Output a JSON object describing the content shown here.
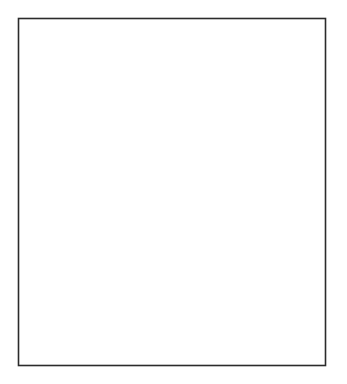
{
  "figure": {
    "width": 347,
    "height": 384,
    "background": "#ffffff",
    "border_color": "#2b2b2b",
    "axis_color": "#2b2b2b"
  },
  "chart_data": [
    {
      "type": "line",
      "panel": "top",
      "title": "Percent with High Risk Behavior",
      "xlabel": "",
      "ylabel": "",
      "xlim": [
        1981,
        1993
      ],
      "ylim": [
        0,
        75
      ],
      "yticks": [
        0,
        10,
        20,
        30,
        40,
        50,
        60,
        70
      ],
      "ytick_labels": [
        "0",
        "10",
        "20",
        "30",
        "40",
        "50",
        "60",
        "70"
      ],
      "xticks": [
        1981,
        1982,
        1983,
        1984,
        1985,
        1986,
        1987,
        1988,
        1989,
        1990,
        1991,
        1992,
        1993
      ],
      "xtick_labels": [],
      "grid": false,
      "legend": "none",
      "series": [
        {
          "name": "Percent with high risk behavior",
          "color": "#3a3a3a",
          "x": [
            1981.0,
            1981.5,
            1982.0,
            1982.5,
            1983.0,
            1983.2,
            1983.4,
            1983.6,
            1983.8,
            1984.0,
            1984.2,
            1984.4,
            1984.6,
            1984.8,
            1985.0,
            1985.2,
            1985.4,
            1985.6,
            1985.8,
            1986.0,
            1986.2,
            1986.4,
            1986.6,
            1986.8,
            1987.0,
            1987.1,
            1987.3,
            1987.6,
            1988.0,
            1988.4,
            1988.8,
            1989.2,
            1989.6,
            1990.0,
            1990.4,
            1990.8,
            1991.2,
            1991.6,
            1992.0,
            1992.4,
            1992.8,
            1993.0
          ],
          "y": [
            75.0,
            75.0,
            75.0,
            75.0,
            74.5,
            72.0,
            68.5,
            66.0,
            65.0,
            64.0,
            62.5,
            61.0,
            59.5,
            58.5,
            57.5,
            57.0,
            56.5,
            53.0,
            48.0,
            44.0,
            41.0,
            40.5,
            40.0,
            38.0,
            33.0,
            29.0,
            24.5,
            23.0,
            22.0,
            21.5,
            21.0,
            22.5,
            23.5,
            24.5,
            25.5,
            26.0,
            26.5,
            27.5,
            28.0,
            28.5,
            28.5,
            28.5
          ]
        }
      ],
      "error_bars": [
        {
          "x": 1984.55,
          "y": 59.0,
          "yerr_low": 4.5,
          "yerr_high": 5.5,
          "cap": true
        },
        {
          "x": 1987.15,
          "y": 23.5,
          "yerr_low": 5.0,
          "yerr_high": 6.5,
          "cap": false
        }
      ],
      "box_markers": [
        {
          "x": 1989.3,
          "y_low": 25.0,
          "y_high": 34.5,
          "width_years": 0.22,
          "color": "#4a4a4a"
        }
      ]
    },
    {
      "type": "scatter",
      "panel": "bottom",
      "title": "Healthy Infected Gays (in 100,000s)",
      "xlabel": "Year (1981 - 1991)",
      "ylabel": "",
      "xlim": [
        1981,
        1993
      ],
      "ylim": [
        0,
        6
      ],
      "yticks": [
        0,
        1,
        2,
        3,
        4,
        5,
        6
      ],
      "ytick_labels": [
        "0",
        "1",
        "2",
        "3",
        "4",
        "5",
        "6"
      ],
      "xticks": [
        1981,
        1982,
        1983,
        1984,
        1985,
        1986,
        1987,
        1988,
        1989,
        1990,
        1991,
        1992,
        1993
      ],
      "xtick_labels": [
        "1981",
        "",
        "1983",
        "",
        "1985",
        "",
        "1987",
        "",
        "1989",
        "",
        "1991",
        "",
        "1993"
      ],
      "grid": false,
      "legend": "none",
      "points": [
        {
          "x": 1981.0,
          "y": 0.35,
          "yerr": 0.0
        },
        {
          "x": 1982.0,
          "y": 0.85,
          "yerr": 0.0
        },
        {
          "x": 1983.0,
          "y": 1.58,
          "yerr": 0.0
        },
        {
          "x": 1984.0,
          "y": 2.48,
          "yerr": 0.0
        },
        {
          "x": 1985.0,
          "y": 3.4,
          "yerr": 0.13
        },
        {
          "x": 1986.0,
          "y": 4.2,
          "yerr": 0.1
        },
        {
          "x": 1987.0,
          "y": 4.8,
          "yerr": 0.15
        },
        {
          "x": 1988.0,
          "y": 5.18,
          "yerr": 0.28
        },
        {
          "x": 1989.0,
          "y": 5.25,
          "yerr": 0.52
        }
      ],
      "series": [
        {
          "name": "model-dark",
          "color": "#1a1a1a",
          "x": [
            1981.0,
            1981.4,
            1981.8,
            1982.2,
            1982.6,
            1983.0,
            1983.4,
            1983.8,
            1984.2,
            1984.6,
            1985.0,
            1985.4,
            1985.8,
            1986.2,
            1986.6,
            1987.0,
            1987.4,
            1987.8,
            1988.2,
            1988.6,
            1989.0,
            1989.5,
            1990.0,
            1990.5,
            1991.0,
            1991.5,
            1992.0,
            1992.5,
            1993.0
          ],
          "y": [
            0.33,
            0.4,
            0.5,
            0.62,
            0.8,
            1.02,
            1.32,
            1.7,
            2.15,
            2.68,
            3.22,
            3.72,
            4.15,
            4.52,
            4.82,
            5.02,
            5.12,
            5.17,
            5.19,
            5.2,
            5.21,
            5.23,
            5.27,
            5.33,
            5.41,
            5.51,
            5.62,
            5.72,
            5.78
          ]
        },
        {
          "name": "model-light",
          "color": "#b7b7b7",
          "x": [
            1981.0,
            1981.4,
            1981.8,
            1982.2,
            1982.6,
            1983.0,
            1983.4,
            1983.8,
            1984.2,
            1984.6,
            1985.0,
            1985.4,
            1985.8,
            1986.2,
            1986.6,
            1987.0,
            1987.4,
            1987.8,
            1988.2,
            1988.6,
            1989.0,
            1989.5,
            1990.0,
            1990.5,
            1991.0,
            1991.5,
            1992.0,
            1992.5,
            1993.0
          ],
          "y": [
            0.35,
            0.44,
            0.56,
            0.7,
            0.9,
            1.14,
            1.46,
            1.86,
            2.32,
            2.84,
            3.38,
            3.86,
            4.26,
            4.62,
            4.9,
            5.08,
            5.16,
            5.2,
            5.21,
            5.22,
            5.22,
            5.24,
            5.28,
            5.34,
            5.42,
            5.52,
            5.62,
            5.72,
            5.78
          ]
        }
      ]
    }
  ]
}
